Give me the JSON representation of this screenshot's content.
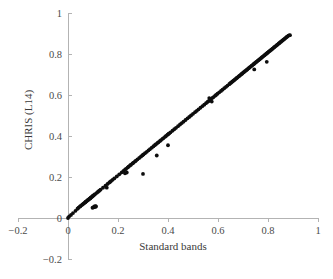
{
  "chart_data": {
    "type": "scatter",
    "title": "",
    "xlabel": "Standard bands",
    "ylabel": "CHRIS (L14)",
    "xlim": [
      -0.2,
      1.0
    ],
    "ylim": [
      -0.2,
      1.0
    ],
    "xticks": [
      -0.2,
      0,
      0.2,
      0.4,
      0.6,
      0.8,
      1
    ],
    "yticks": [
      -0.2,
      0,
      0.2,
      0.4,
      0.6,
      0.8,
      1
    ],
    "xticklabels": [
      "−0.2",
      "0",
      "0.2",
      "0.4",
      "0.6",
      "0.8",
      "1"
    ],
    "yticklabels": [
      "−0.2",
      "0",
      "0.2",
      "0.4",
      "0.6",
      "0.8",
      "1"
    ],
    "grid": false,
    "legend": null,
    "marker": "circle",
    "marker_color": "#0d0d0d",
    "axis_color": "#b3b3b3",
    "trend": {
      "type": "line",
      "x": [
        0.0,
        0.89
      ],
      "y": [
        0.0,
        0.892
      ],
      "slope": 1.002,
      "intercept": 0.0,
      "color": "#8a8a8a"
    },
    "x": [
      0.0,
      0.005,
      0.012,
      0.02,
      0.03,
      0.038,
      0.042,
      0.048,
      0.05,
      0.055,
      0.058,
      0.062,
      0.065,
      0.068,
      0.07,
      0.072,
      0.075,
      0.078,
      0.08,
      0.082,
      0.085,
      0.088,
      0.09,
      0.092,
      0.095,
      0.098,
      0.1,
      0.102,
      0.105,
      0.108,
      0.11,
      0.112,
      0.108,
      0.103,
      0.098,
      0.115,
      0.12,
      0.125,
      0.13,
      0.14,
      0.15,
      0.158,
      0.165,
      0.168,
      0.172,
      0.178,
      0.185,
      0.195,
      0.205,
      0.215,
      0.222,
      0.228,
      0.232,
      0.238,
      0.242,
      0.248,
      0.252,
      0.258,
      0.262,
      0.268,
      0.272,
      0.278,
      0.285,
      0.292,
      0.298,
      0.302,
      0.308,
      0.315,
      0.322,
      0.328,
      0.335,
      0.342,
      0.348,
      0.352,
      0.358,
      0.362,
      0.368,
      0.372,
      0.378,
      0.382,
      0.388,
      0.392,
      0.398,
      0.402,
      0.405,
      0.41,
      0.418,
      0.425,
      0.432,
      0.44,
      0.448,
      0.455,
      0.462,
      0.47,
      0.478,
      0.485,
      0.492,
      0.5,
      0.508,
      0.515,
      0.522,
      0.53,
      0.538,
      0.545,
      0.552,
      0.558,
      0.562,
      0.568,
      0.572,
      0.578,
      0.582,
      0.588,
      0.592,
      0.598,
      0.605,
      0.612,
      0.618,
      0.625,
      0.632,
      0.638,
      0.645,
      0.648,
      0.652,
      0.655,
      0.658,
      0.662,
      0.665,
      0.668,
      0.672,
      0.675,
      0.678,
      0.682,
      0.685,
      0.688,
      0.692,
      0.695,
      0.698,
      0.702,
      0.705,
      0.708,
      0.712,
      0.715,
      0.718,
      0.722,
      0.725,
      0.728,
      0.732,
      0.735,
      0.738,
      0.742,
      0.745,
      0.748,
      0.752,
      0.755,
      0.758,
      0.762,
      0.765,
      0.768,
      0.772,
      0.775,
      0.778,
      0.782,
      0.785,
      0.788,
      0.792,
      0.795,
      0.798,
      0.802,
      0.805,
      0.808,
      0.812,
      0.815,
      0.818,
      0.822,
      0.825,
      0.828,
      0.832,
      0.835,
      0.838,
      0.842,
      0.845,
      0.848,
      0.852,
      0.855,
      0.858,
      0.862,
      0.865,
      0.868,
      0.872,
      0.875,
      0.878,
      0.882,
      0.885,
      0.888,
      0.3,
      0.355,
      0.4,
      0.235,
      0.228,
      0.575,
      0.565,
      0.745,
      0.795,
      0.155,
      0.088,
      0.105
    ],
    "y": [
      0.0,
      0.008,
      0.015,
      0.024,
      0.035,
      0.045,
      0.05,
      0.056,
      0.058,
      0.063,
      0.066,
      0.07,
      0.073,
      0.076,
      0.078,
      0.08,
      0.083,
      0.086,
      0.088,
      0.09,
      0.093,
      0.096,
      0.098,
      0.1,
      0.103,
      0.106,
      0.108,
      0.11,
      0.113,
      0.116,
      0.058,
      0.056,
      0.054,
      0.052,
      0.05,
      0.123,
      0.128,
      0.133,
      0.138,
      0.148,
      0.158,
      0.166,
      0.173,
      0.176,
      0.18,
      0.186,
      0.193,
      0.203,
      0.213,
      0.223,
      0.23,
      0.236,
      0.24,
      0.246,
      0.25,
      0.256,
      0.26,
      0.266,
      0.27,
      0.276,
      0.28,
      0.286,
      0.293,
      0.3,
      0.306,
      0.31,
      0.316,
      0.323,
      0.33,
      0.336,
      0.343,
      0.35,
      0.356,
      0.36,
      0.366,
      0.37,
      0.376,
      0.38,
      0.386,
      0.39,
      0.396,
      0.4,
      0.406,
      0.41,
      0.413,
      0.418,
      0.426,
      0.433,
      0.44,
      0.448,
      0.456,
      0.463,
      0.47,
      0.478,
      0.486,
      0.493,
      0.5,
      0.508,
      0.516,
      0.523,
      0.53,
      0.538,
      0.546,
      0.553,
      0.56,
      0.566,
      0.57,
      0.576,
      0.58,
      0.586,
      0.59,
      0.596,
      0.6,
      0.606,
      0.613,
      0.62,
      0.626,
      0.633,
      0.64,
      0.646,
      0.653,
      0.656,
      0.66,
      0.663,
      0.666,
      0.67,
      0.673,
      0.676,
      0.68,
      0.683,
      0.686,
      0.69,
      0.693,
      0.696,
      0.7,
      0.703,
      0.706,
      0.71,
      0.713,
      0.716,
      0.72,
      0.723,
      0.726,
      0.73,
      0.733,
      0.736,
      0.74,
      0.743,
      0.746,
      0.75,
      0.753,
      0.756,
      0.76,
      0.763,
      0.766,
      0.77,
      0.773,
      0.776,
      0.78,
      0.783,
      0.786,
      0.79,
      0.793,
      0.796,
      0.8,
      0.803,
      0.806,
      0.81,
      0.813,
      0.816,
      0.82,
      0.823,
      0.826,
      0.83,
      0.833,
      0.836,
      0.84,
      0.843,
      0.846,
      0.85,
      0.853,
      0.856,
      0.86,
      0.863,
      0.866,
      0.87,
      0.873,
      0.876,
      0.88,
      0.883,
      0.886,
      0.89,
      0.891,
      0.892,
      0.215,
      0.305,
      0.355,
      0.222,
      0.218,
      0.568,
      0.585,
      0.725,
      0.762,
      0.148,
      0.095,
      0.056
    ]
  },
  "axis": {
    "x_title": "Standard bands",
    "y_title": "CHRIS (L14)"
  }
}
